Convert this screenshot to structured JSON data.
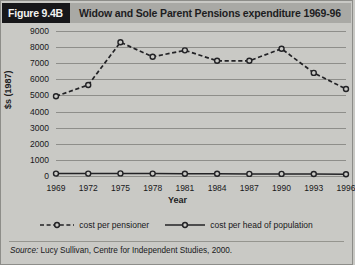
{
  "figure": {
    "badge": "Figure 9.4B",
    "title": "Widow and Sole Parent Pensions expenditure 1969-96",
    "source_prefix": "Source:",
    "source_text": "Lucy Sullivan, Centre for Independent Studies, 2000."
  },
  "colors": {
    "badge_bg": "#17171a",
    "badge_text": "#f2f2f0",
    "header_bg": "#a9a9a5",
    "page_bg": "#c9c9c5",
    "gridline": "#8e8e8a",
    "series_line": "#222225"
  },
  "chart_data": {
    "type": "line",
    "title": "Widow and Sole Parent Pensions expenditure 1969-96",
    "xlabel": "Year",
    "ylabel": "$s (1987)",
    "x": [
      1969,
      1972,
      1975,
      1978,
      1981,
      1984,
      1987,
      1990,
      1993,
      1996
    ],
    "xtick_labels": [
      "1969",
      "1972",
      "1975",
      "1978",
      "1981",
      "1984",
      "1987",
      "1990",
      "1993",
      "1996"
    ],
    "ytick_labels": [
      "9000",
      "8000",
      "7000",
      "6000",
      "5000",
      "4000",
      "3000",
      "2000",
      "1000",
      "0"
    ],
    "yticks": [
      9000,
      8000,
      7000,
      6000,
      5000,
      4000,
      3000,
      2000,
      1000,
      0
    ],
    "ylim": [
      0,
      9000
    ],
    "grid": true,
    "legend_position": "bottom",
    "series": [
      {
        "name": "cost per pensioner",
        "style": "dashed",
        "marker": "open-circle",
        "values": [
          4950,
          5650,
          8300,
          7400,
          7800,
          7150,
          7150,
          7900,
          6400,
          5400
        ]
      },
      {
        "name": "cost per head of population",
        "style": "solid",
        "marker": "open-circle",
        "values": [
          150,
          150,
          160,
          150,
          140,
          140,
          130,
          130,
          120,
          110
        ]
      }
    ]
  }
}
